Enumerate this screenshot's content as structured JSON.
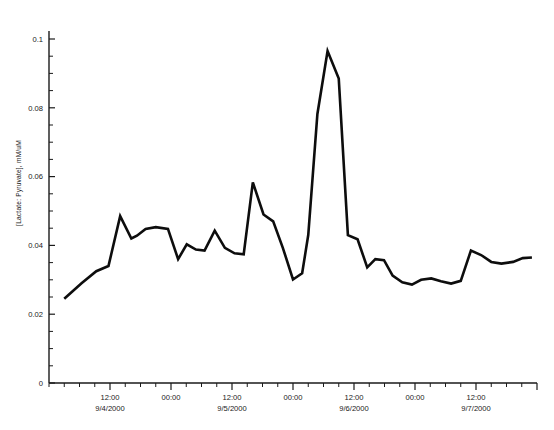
{
  "chart_data": {
    "type": "line",
    "title": "",
    "subtitle": "",
    "xlabel": "",
    "ylabel": "[Lactate: Pyruvate], mM/uM",
    "ylim": [
      0,
      0.105
    ],
    "ytick_values": [
      0,
      0.02,
      0.04,
      0.06,
      0.08,
      0.1
    ],
    "ytick_labels": [
      "0",
      "0.02",
      "0.04",
      "0.06",
      "0.08",
      "0.1"
    ],
    "yminor_step": 0.005,
    "grid": false,
    "legend": null,
    "xtick_labels": [
      {
        "time": "12:00",
        "date": "9/4/2000"
      },
      {
        "time": "00:00",
        "date": ""
      },
      {
        "time": "12:00",
        "date": "9/5/2000"
      },
      {
        "time": "00:00",
        "date": ""
      },
      {
        "time": "12:00",
        "date": "9/6/2000"
      },
      {
        "time": "00:00",
        "date": ""
      },
      {
        "time": "12:00",
        "date": "9/7/2000"
      }
    ],
    "xlim_hours": [
      0,
      96
    ],
    "series": [
      {
        "name": "Lactate:Pyruvate ratio",
        "color": "#0d0d0d",
        "x_hours": [
          3.0,
          6.4,
          9.3,
          11.7,
          14.0,
          16.2,
          17.3,
          19.0,
          21.0,
          23.4,
          25.4,
          27.1,
          28.9,
          30.6,
          32.6,
          34.6,
          36.5,
          38.3,
          40.1,
          42.2,
          44.1,
          46.0,
          48.0,
          49.8,
          51.0,
          52.8,
          54.8,
          57.0,
          58.8,
          60.7,
          62.6,
          64.2,
          65.9,
          67.6,
          69.5,
          71.4,
          73.2,
          75.2,
          77.1,
          79.1,
          81.0,
          83.0,
          85.0,
          87.0,
          89.0,
          91.3,
          93.2,
          95.0
        ],
        "values": [
          0.0245,
          0.029,
          0.0325,
          0.034,
          0.0485,
          0.042,
          0.0428,
          0.0448,
          0.0453,
          0.0448,
          0.036,
          0.0403,
          0.0388,
          0.0385,
          0.0443,
          0.0393,
          0.0377,
          0.0374,
          0.0583,
          0.049,
          0.047,
          0.0393,
          0.0301,
          0.0319,
          0.043,
          0.0782,
          0.0965,
          0.0885,
          0.043,
          0.0418,
          0.0336,
          0.036,
          0.0357,
          0.0312,
          0.0293,
          0.0286,
          0.03,
          0.0304,
          0.0296,
          0.0289,
          0.0297,
          0.0385,
          0.0372,
          0.0352,
          0.0347,
          0.0352,
          0.0363,
          0.0365
        ]
      }
    ]
  },
  "axes": {
    "y_axis_title": "[Lactate: Pyruvate], mM/uM"
  }
}
